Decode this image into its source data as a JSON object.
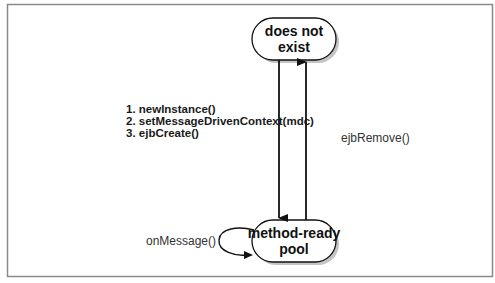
{
  "diagram": {
    "type": "state-diagram",
    "colors": {
      "frame": "#8a8a8a",
      "stroke": "#111111",
      "shadow": "#bdbdbd",
      "node_fill": "#ffffff"
    },
    "states": [
      {
        "id": "does-not-exist",
        "lines": [
          "does not",
          "exist"
        ]
      },
      {
        "id": "method-ready-pool",
        "lines": [
          "method-ready",
          "pool"
        ]
      }
    ],
    "transitions": [
      {
        "from": "does-not-exist",
        "to": "method-ready-pool",
        "labels": [
          "1. newInstance()",
          "2. setMessageDrivenContext(mdc)",
          "3. ejbCreate()"
        ]
      },
      {
        "from": "method-ready-pool",
        "to": "does-not-exist",
        "labels": [
          "ejbRemove()"
        ]
      },
      {
        "from": "method-ready-pool",
        "to": "method-ready-pool",
        "labels": [
          "onMessage()"
        ]
      }
    ]
  }
}
